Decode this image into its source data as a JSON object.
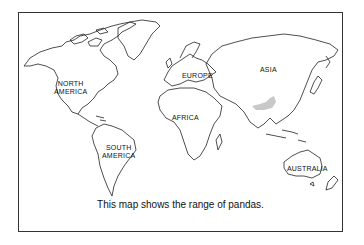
{
  "map": {
    "caption": "This map shows the range of pandas.",
    "labels": {
      "north_america_1": "NORTH",
      "north_america_2": "AMERICA",
      "south_america_1": "SOUTH",
      "south_america_2": "AMERICA",
      "europe": "EUROPE",
      "asia": "ASIA",
      "africa": "AFRICA",
      "australia": "AUSTRALIA"
    },
    "highlight": {
      "name": "panda range",
      "color": "#c8c8c8"
    },
    "colors": {
      "outline": "#222222",
      "frame": "#333333",
      "background": "#ffffff"
    }
  }
}
